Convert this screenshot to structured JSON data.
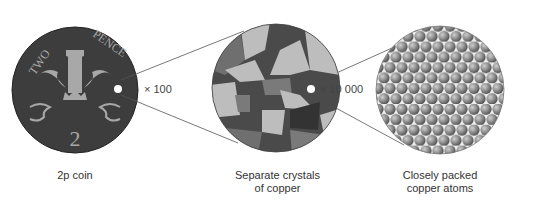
{
  "coin": {
    "caption": "2p coin",
    "top_text_left": "TWO",
    "top_text_right": "PENCE",
    "value": "2"
  },
  "crystals": {
    "caption_line1": "Separate crystals",
    "caption_line2": "of copper"
  },
  "atoms": {
    "caption_line1": "Closely packed",
    "caption_line2": "copper atoms"
  },
  "magnifications": {
    "first": "× 100",
    "second": "× 10 000"
  },
  "colors": {
    "coin": "#3d3d3d",
    "emblem": "#a8a8a8",
    "atom": "#8a8a8a"
  }
}
